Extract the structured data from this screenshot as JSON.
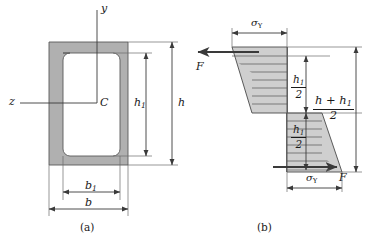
{
  "figure": {
    "colors": {
      "section_fill": "#b0b0b0",
      "stress_fill": "#cfcfcf",
      "line": "#3a3a3a",
      "text": "#1a1a1a",
      "background": "#ffffff"
    },
    "parts": [
      {
        "key": "a",
        "caption": "(a)",
        "description": "hollow rectangular (box) cross section with centroid C and axes y, z"
      },
      {
        "key": "b",
        "caption": "(b)",
        "description": "fully plastic normal stress distribution with resultant forces F"
      }
    ]
  },
  "section_a": {
    "caption": "(a)",
    "axis_y_label": "y",
    "axis_z_label": "z",
    "centroid_label": "C",
    "dim_height_outer": "h",
    "dim_height_inner": "h",
    "dim_height_inner_sub": "1",
    "dim_width_outer": "b",
    "dim_width_inner": "b",
    "dim_width_inner_sub": "1"
  },
  "section_b": {
    "caption": "(b)",
    "stress_label_top": "σ",
    "stress_label_top_sub": "Y",
    "stress_label_bottom": "σ",
    "stress_label_bottom_sub": "Y",
    "force_label_top": "F",
    "force_label_bottom": "F",
    "dim_upper_numerator": "h",
    "dim_upper_numerator_sub": "1",
    "dim_upper_denominator": "2",
    "dim_lower_numerator": "h",
    "dim_lower_numerator_sub": "1",
    "dim_lower_denominator": "2",
    "dim_total_numerator": "h + h",
    "dim_total_numerator_sub": "1",
    "dim_total_denominator": "2"
  }
}
